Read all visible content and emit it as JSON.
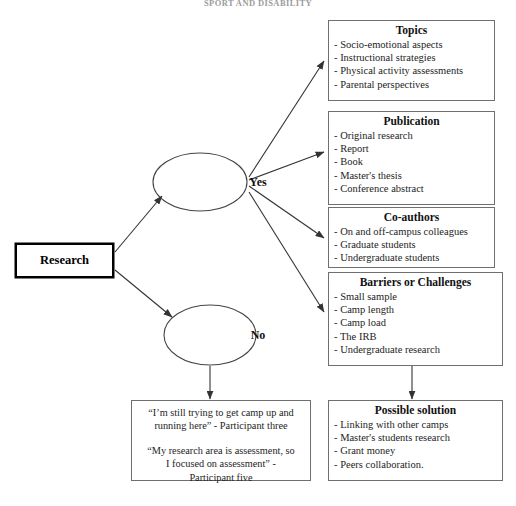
{
  "document": {
    "running_head": "SPORT AND DISABILITY"
  },
  "diagram": {
    "type": "flowchart",
    "root": {
      "label": "Research"
    },
    "decisions": [
      {
        "label": "Yes"
      },
      {
        "label": "No"
      }
    ],
    "boxes": [
      {
        "id": "topics",
        "title": "Topics",
        "items": [
          "Socio-emotional aspects",
          "Instructional strategies",
          "Physical activity assessments",
          "Parental perspectives"
        ]
      },
      {
        "id": "publication",
        "title": "Publication",
        "items": [
          "Original research",
          "Report",
          "Book",
          "Master's thesis",
          "Conference abstract"
        ]
      },
      {
        "id": "co-authors",
        "title": "Co-authors",
        "items": [
          "On and off-campus colleagues",
          "Graduate students",
          "Undergraduate students"
        ]
      },
      {
        "id": "barriers",
        "title": "Barriers or Challenges",
        "items": [
          "Small sample",
          "Camp length",
          "Camp load",
          "The IRB",
          "Undergraduate research"
        ]
      },
      {
        "id": "possible-solution",
        "title": "Possible solution",
        "items": [
          "Linking with other camps",
          "Master's students research",
          "Grant money",
          "Peers collaboration."
        ]
      }
    ],
    "quotes": {
      "id": "participant-quotes",
      "block_one": [
        "“I’m still trying to get camp up and",
        "running here” - Participant three"
      ],
      "block_two": [
        "“My research area is assessment, so",
        "I focused on assessment” -",
        "Participant five"
      ]
    },
    "colors": {
      "box_border": "#6f6f6f",
      "root_border": "#000000",
      "connector": "#333333",
      "background": "#ffffff"
    }
  }
}
